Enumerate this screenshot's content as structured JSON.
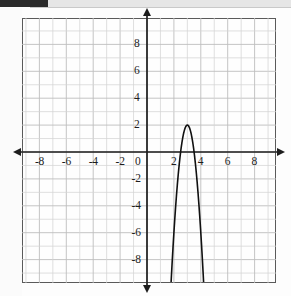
{
  "figure": {
    "kind": "coordinate-plane-graph",
    "background_color": "#fdfdfd",
    "grid_color": "#bdbdbd",
    "grid_minor_color": "#d4d4d4",
    "border_color": "#5a5a5a",
    "axis_color": "#1d1d1d",
    "curve_color": "#111111",
    "origin_label": "0"
  },
  "artifacts": {
    "top_left_bar_color": "#2b2b2b",
    "top_band_color": "#e6e6e6"
  },
  "axis_labels": {
    "x_negative": [
      "-8",
      "-6",
      "-4",
      "-2"
    ],
    "x_positive": [
      "2",
      "4",
      "6",
      "8"
    ],
    "y_positive": [
      "2",
      "4",
      "6",
      "8"
    ],
    "y_negative": [
      "-2",
      "-4",
      "-6",
      "-8"
    ]
  },
  "chart_data": {
    "type": "line",
    "title": "",
    "xlabel": "",
    "ylabel": "",
    "xlim": [
      -9,
      9
    ],
    "ylim": [
      -9,
      9
    ],
    "xticks": [
      -8,
      -6,
      -4,
      -2,
      0,
      2,
      4,
      6,
      8
    ],
    "yticks": [
      -8,
      -6,
      -4,
      -2,
      0,
      2,
      4,
      6,
      8
    ],
    "grid": true,
    "grid_step": 1,
    "legend": "none",
    "series": [
      {
        "name": "parabola",
        "equation": "y = -8(x - 3)^2 + 2",
        "orientation": "opens-down",
        "vertex": [
          3,
          2
        ],
        "roots": [
          2.5,
          3.5
        ],
        "y_intercept": -70,
        "x": [
          2.0,
          2.1,
          2.2,
          2.3,
          2.4,
          2.5,
          2.6,
          2.7,
          2.8,
          2.9,
          3.0,
          3.1,
          3.2,
          3.3,
          3.4,
          3.5,
          3.6,
          3.7,
          3.8,
          3.9,
          4.0
        ],
        "y": [
          -6.0,
          -4.48,
          -3.12,
          -1.92,
          -0.88,
          0.0,
          0.72,
          1.28,
          1.68,
          1.92,
          2.0,
          1.92,
          1.68,
          1.28,
          0.72,
          0.0,
          -0.88,
          -1.92,
          -3.12,
          -4.48,
          -6.0
        ]
      }
    ]
  }
}
